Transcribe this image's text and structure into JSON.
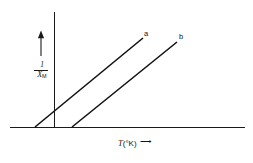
{
  "figure": {
    "background_color": "#ffffff",
    "ink_color": "#141414",
    "width": 253,
    "height": 163
  },
  "axes": {
    "x_axis": {
      "label_variable": "T",
      "label_units": "(°K)",
      "arrow_glyph": "⟶",
      "has_arrow": true,
      "has_ticks": false,
      "origin_x": 54,
      "baseline_y": 127,
      "left_x": 10,
      "right_x": 245
    },
    "y_axis": {
      "label_numerator": "1",
      "label_denominator": "X",
      "label_subscript": "M",
      "arrow_glyph": "↑",
      "has_arrow": true,
      "has_ticks": false,
      "top_y": 12,
      "bottom_y": 127,
      "x": 54
    }
  },
  "chart_data": {
    "type": "line",
    "title": "",
    "xlabel": "T (°K)",
    "ylabel": "1/X_M",
    "grid": false,
    "legend": "inline-end-labels",
    "axis_ticks": "none",
    "series": [
      {
        "name": "a",
        "label": "a",
        "points": [
          [
            35,
            127
          ],
          [
            143,
            38
          ]
        ],
        "x_intercept": -19,
        "label_position": "top-right"
      },
      {
        "name": "b",
        "label": "b",
        "points": [
          [
            72,
            127
          ],
          [
            177,
            42
          ]
        ],
        "x_intercept": 18,
        "label_position": "top-right"
      }
    ]
  }
}
